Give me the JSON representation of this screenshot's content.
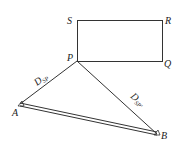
{
  "diagram": {
    "points": {
      "S": {
        "label": "S"
      },
      "R": {
        "label": "R"
      },
      "P": {
        "label": "P"
      },
      "Q": {
        "label": "Q"
      },
      "A": {
        "label": "A"
      },
      "B": {
        "label": "B"
      }
    },
    "distances": {
      "PA": {
        "main": "D",
        "sub": "SP"
      },
      "PB": {
        "main": "D",
        "sub": "SP'"
      }
    },
    "colors": {
      "stroke": "#333333",
      "background": "#ffffff"
    }
  }
}
